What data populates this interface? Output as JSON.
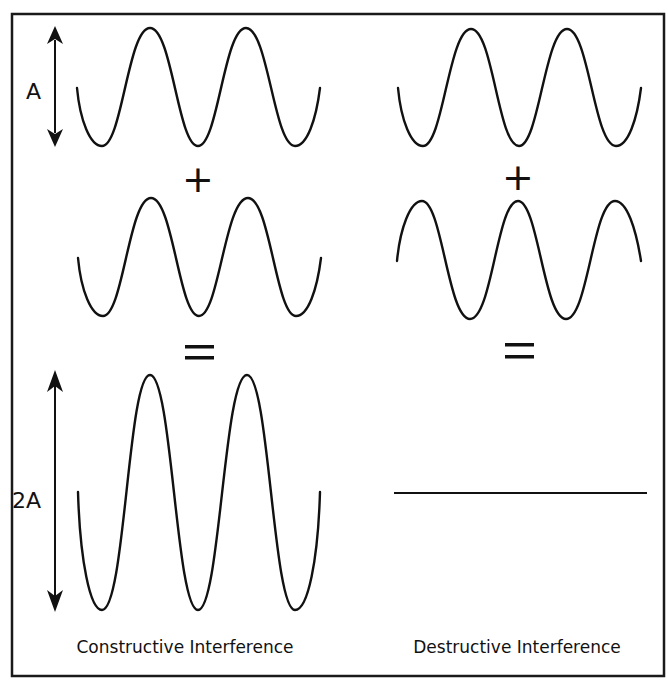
{
  "diagram": {
    "type": "wave-interference",
    "labels": {
      "amplitude": "A",
      "double_amplitude": "2A",
      "plus_symbol": "+",
      "equals_symbol": "=",
      "constructive_caption": "Constructive Interference",
      "destructive_caption": "Destructive Interference"
    },
    "colors": {
      "background": "#ffffff",
      "stroke": "#111111",
      "frame": "#1a1a1a"
    },
    "panels": [
      {
        "name": "constructive",
        "input_wave_1": {
          "amplitude": "A",
          "phase": "in-phase"
        },
        "input_wave_2": {
          "amplitude": "A",
          "phase": "in-phase"
        },
        "result": {
          "amplitude": "2A",
          "shape": "sine wave"
        }
      },
      {
        "name": "destructive",
        "input_wave_1": {
          "amplitude": "A",
          "phase": "0"
        },
        "input_wave_2": {
          "amplitude": "A",
          "phase": "180° out of phase"
        },
        "result": {
          "amplitude": "0",
          "shape": "flat line"
        }
      }
    ]
  }
}
